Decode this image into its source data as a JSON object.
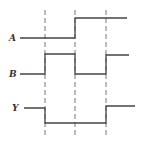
{
  "diagram": {
    "type": "timing-diagram",
    "signals": [
      {
        "name": "A",
        "levels": [
          0,
          0,
          1,
          1
        ]
      },
      {
        "name": "B",
        "levels": [
          0,
          1,
          0,
          1
        ]
      },
      {
        "name": "Y",
        "levels": [
          1,
          0,
          0,
          1
        ]
      }
    ],
    "time_markers": 3,
    "colors": {
      "line": "#444444",
      "background": "#ffffff"
    }
  }
}
